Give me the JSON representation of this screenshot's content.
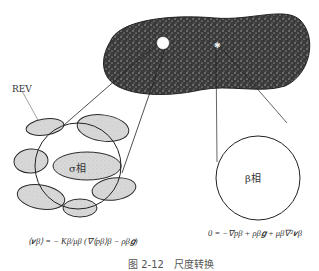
{
  "diagram": {
    "rev_label": "REV",
    "sigma_phase_label": "σ相",
    "beta_phase_label": "β相",
    "equation_left": "⟨v_β⟩ = − (K_β / μ_β)(∇⟨p_β⟩^β − ρ_β g)",
    "equation_left_display": "⟨𝒗β⟩ = − Kβ/μβ (∇⟨pβ⟩β − ρβ𝒈)",
    "equation_right": "0 = −∇p_β + ρ_β g + μ_β ∇² v_β",
    "equation_right_display": "0 = −∇pβ + ρβ𝒈 + μβ∇²𝒗β",
    "caption": "图 2-12　尺度转换",
    "colors": {
      "porous_body": "#3a3a3a",
      "grain_fill": "#d6d6d6",
      "outline": "#222222"
    }
  }
}
